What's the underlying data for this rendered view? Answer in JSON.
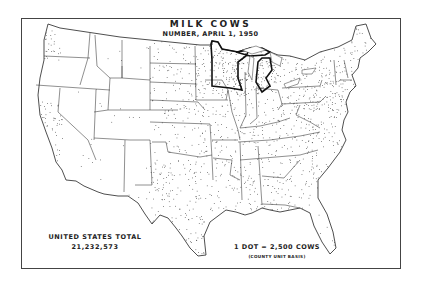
{
  "map": {
    "title": "MILK COWS",
    "subtitle": "NUMBER, APRIL 1, 1950",
    "total_label": "UNITED STATES TOTAL",
    "total_value": "21,232,573",
    "dot_key": "1 DOT = 2,500 COWS",
    "dot_key_note": "(COUNTY UNIT BASIS)",
    "type": "dot density map",
    "region": "Conterminous United States",
    "highlighted_region": "Minnesota, Wisconsin, Michigan (heavy outline)",
    "colors": {
      "ink": "#222222",
      "background": "#ffffff",
      "frame": "#444444"
    }
  }
}
